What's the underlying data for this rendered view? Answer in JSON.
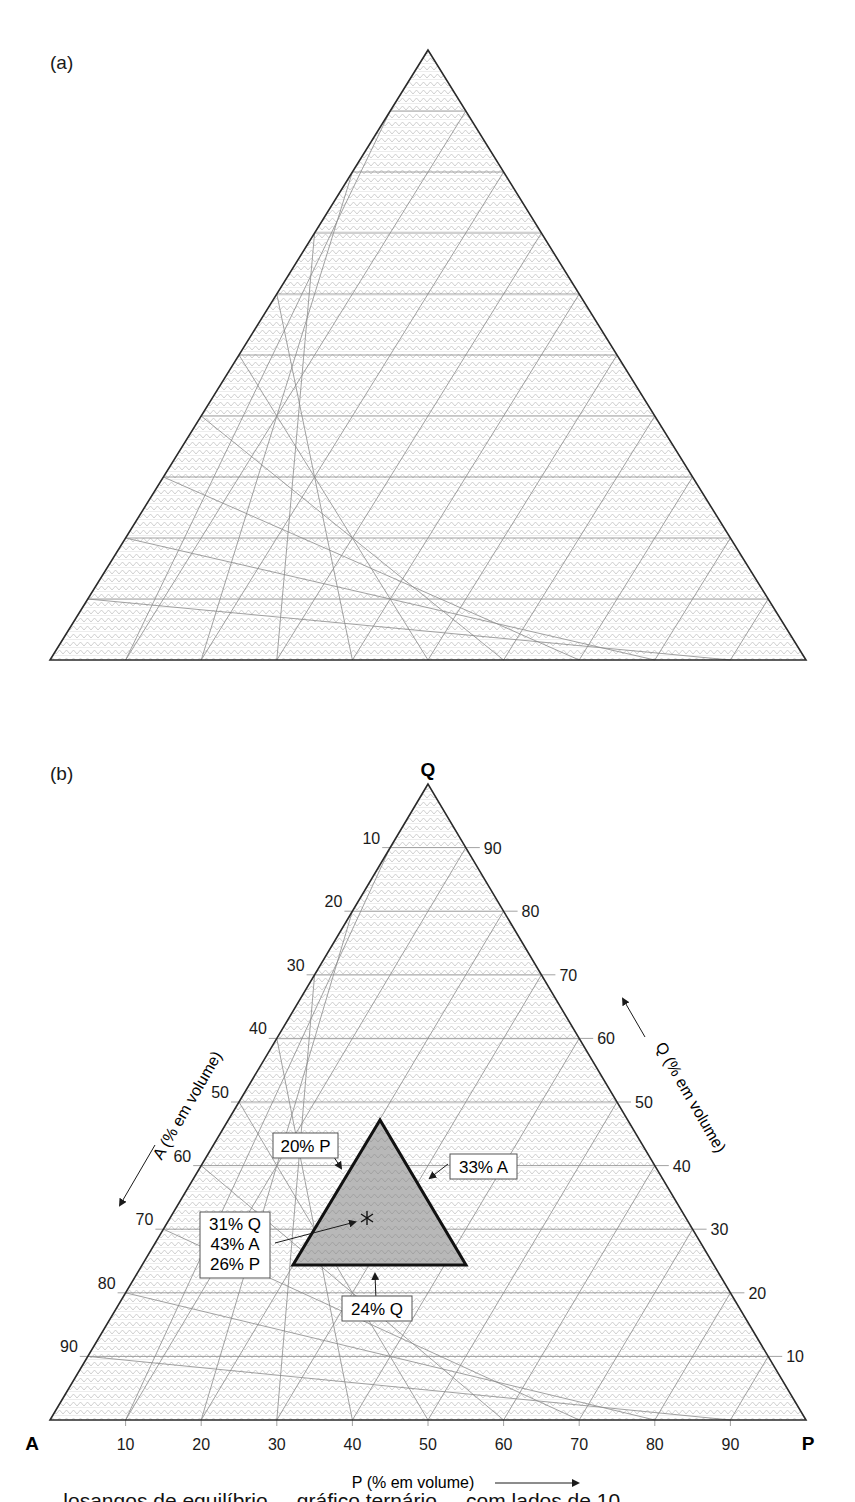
{
  "figure": {
    "panels": [
      {
        "id": "a",
        "label": "(a)",
        "description": "Blank ternary graph with 10% grid"
      },
      {
        "id": "b",
        "label": "(b)",
        "description": "Ternary QAP diagram with plotted composition"
      }
    ],
    "caption_partial": "... losangos de equilíbrio ... gráfico ternário ... com lados de 10 ..."
  },
  "chart_data": [
    {
      "type": "ternary",
      "panel": "a",
      "title": "",
      "vertices": [
        "",
        "",
        ""
      ],
      "grid_step": 10,
      "grid": true,
      "points": []
    },
    {
      "type": "ternary",
      "panel": "b",
      "title": "",
      "vertices": {
        "top": "Q",
        "left": "A",
        "right": "P"
      },
      "axes": {
        "Q": {
          "label": "Q (% em volume)",
          "ticks": [
            10,
            20,
            30,
            40,
            50,
            60,
            70,
            80,
            90
          ],
          "side": "right"
        },
        "A": {
          "label": "A (% em volume)",
          "ticks": [
            10,
            20,
            30,
            40,
            50,
            60,
            70,
            80,
            90
          ],
          "side": "left"
        },
        "P": {
          "label": "P (% em volume)",
          "ticks": [
            10,
            20,
            30,
            40,
            50,
            60,
            70,
            80,
            90
          ],
          "side": "bottom"
        }
      },
      "grid_step": 10,
      "grid": true,
      "region": {
        "name": "constraint-triangle",
        "bounds": {
          "P_min": 20,
          "A_min": 33,
          "Q_min": 24
        },
        "fill": "#b5b5b5"
      },
      "annotations": [
        {
          "text": "20% P",
          "target": "left edge of shaded triangle"
        },
        {
          "text": "33% A",
          "target": "right edge of shaded triangle"
        },
        {
          "text": "24% Q",
          "target": "bottom edge of shaded triangle"
        }
      ],
      "points": [
        {
          "Q": 31,
          "A": 43,
          "P": 26,
          "marker": "asterisk",
          "label_lines": [
            "31% Q",
            "43% A",
            "26% P"
          ]
        }
      ]
    }
  ],
  "panel_b": {
    "vertex_labels": {
      "top": "Q",
      "left": "A",
      "right": "P"
    },
    "left_ticks": [
      "10",
      "20",
      "30",
      "40",
      "50",
      "60",
      "70",
      "80",
      "90"
    ],
    "right_ticks": [
      "90",
      "80",
      "70",
      "60",
      "50",
      "40",
      "30",
      "20",
      "10"
    ],
    "bottom_ticks": [
      "10",
      "20",
      "30",
      "40",
      "50",
      "60",
      "70",
      "80",
      "90"
    ],
    "axis_titles": {
      "A": "A (% em volume)",
      "Q": "Q (% em volume)",
      "P": "P (% em volume)"
    },
    "callouts": {
      "p20": "20% P",
      "a33": "33% A",
      "q24": "24% Q",
      "point_q": "31% Q",
      "point_a": "43% A",
      "point_p": "26% P"
    }
  },
  "colors": {
    "outline": "#2a2a2a",
    "grid": "#8a8a8a",
    "hatch": "#bdbdbd",
    "shaded_region": "#b8b8b8",
    "text": "#1a1a1a"
  }
}
